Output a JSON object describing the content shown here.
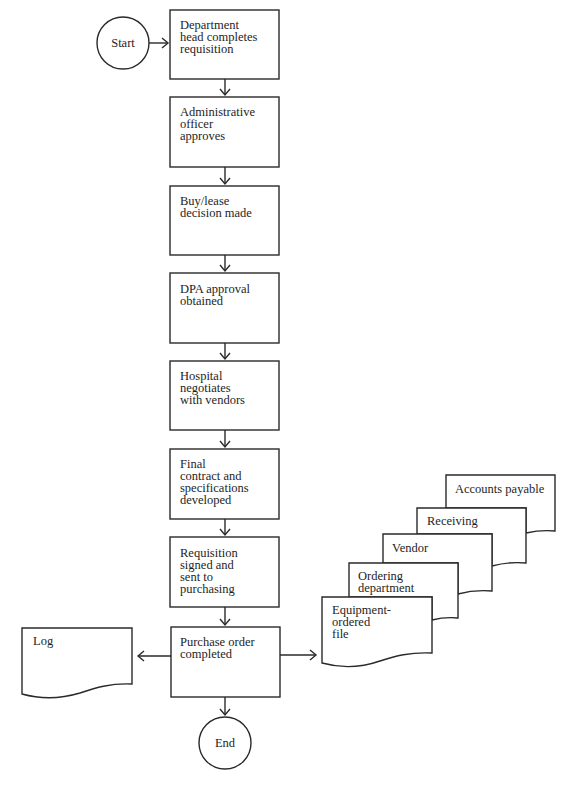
{
  "terminals": {
    "start": {
      "label": "Start"
    },
    "end": {
      "label": "End"
    }
  },
  "process_steps": [
    {
      "label": "Department\nhead completes\nrequisition"
    },
    {
      "label": "Administrative\nofficer\napproves"
    },
    {
      "label": "Buy/lease\ndecision made"
    },
    {
      "label": "DPA approval\nobtained"
    },
    {
      "label": "Hospital\nnegotiates\nwith vendors"
    },
    {
      "label": "Final\ncontract and\nspecifications\ndeveloped"
    },
    {
      "label": "Requisition\nsigned and\nsent to\npurchasing"
    },
    {
      "label": "Purchase order\ncompleted"
    }
  ],
  "outputs": {
    "log": {
      "label": "Log"
    },
    "copies": [
      {
        "label": "Equipment-\nordered\nfile"
      },
      {
        "label": "Ordering\ndepartment"
      },
      {
        "label": "Vendor"
      },
      {
        "label": "Receiving"
      },
      {
        "label": "Accounts payable"
      }
    ]
  },
  "colors": {
    "stroke": "#2a2a2a",
    "background": "#ffffff",
    "text": "#1e1e1e"
  }
}
